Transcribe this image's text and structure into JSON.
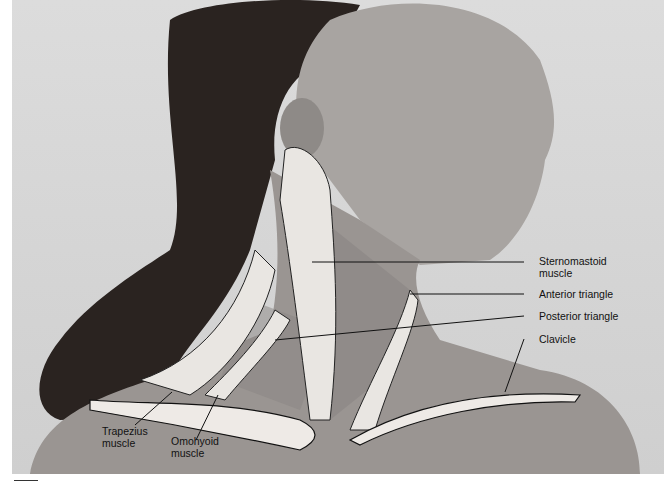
{
  "figure": {
    "labels": {
      "sternomastoid": "Sternomastoid\nmuscle",
      "sternomastoid_1": "Sternomastoid",
      "sternomastoid_2": "muscle",
      "anterior_triangle": "Anterior triangle",
      "posterior_triangle": "Posterior triangle",
      "clavicle": "Clavicle",
      "trapezius_1": "Trapezius",
      "trapezius_2": "muscle",
      "omohyoid_1": "Omohyoid",
      "omohyoid_2": "muscle"
    },
    "colors": {
      "background": "#d6d6d6",
      "hair": "#2a2320",
      "skin": "#9a9592",
      "muscle_fill": "#e9e6e2",
      "label_text": "#111111",
      "leader_line": "#111111"
    }
  }
}
